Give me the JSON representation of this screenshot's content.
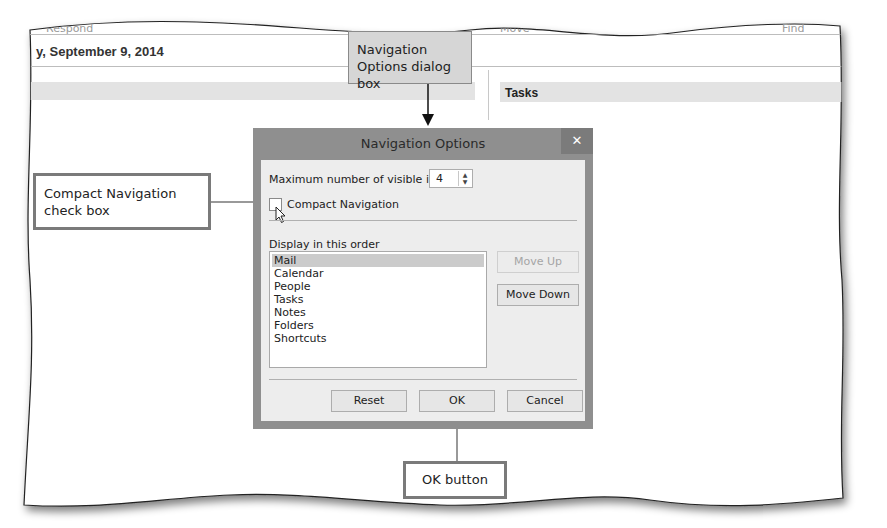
{
  "background_window": {
    "ribbon_labels": [
      "Respond",
      "Move",
      "Find"
    ],
    "date_header": "y, September 9, 2014",
    "tasks_header": "Tasks"
  },
  "callouts": {
    "dialog_callout": [
      "Navigation",
      "Options dialog box"
    ],
    "checkbox_callout": [
      "Compact Navigation",
      "check box"
    ],
    "ok_callout": "OK button"
  },
  "dialog": {
    "title": "Navigation Options",
    "close_glyph": "✕",
    "max_items_label": "Maximum number of visible items:",
    "max_items_value": "4",
    "compact_navigation_label": "Compact Navigation",
    "compact_navigation_checked": false,
    "display_order_label": "Display in this order",
    "order_items": [
      {
        "label": "Mail",
        "selected": true
      },
      {
        "label": "Calendar",
        "selected": false
      },
      {
        "label": "People",
        "selected": false
      },
      {
        "label": "Tasks",
        "selected": false
      },
      {
        "label": "Notes",
        "selected": false
      },
      {
        "label": "Folders",
        "selected": false
      },
      {
        "label": "Shortcuts",
        "selected": false
      }
    ],
    "buttons": {
      "move_up": "Move Up",
      "move_down": "Move Down",
      "reset": "Reset",
      "ok": "OK",
      "cancel": "Cancel"
    }
  },
  "colors": {
    "dialog_frame": "#8f8f8f",
    "dialog_body": "#ededed",
    "callout_fill": "#d6d6d6",
    "callout_border": "#7a7a7a"
  }
}
